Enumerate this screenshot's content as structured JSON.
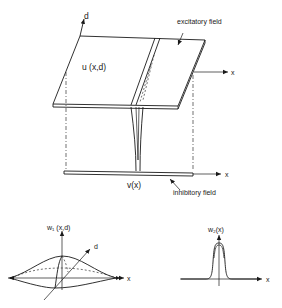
{
  "figure": {
    "top_panel": {
      "excitatory_label": "excitatory field",
      "field_label": "u (x,d)",
      "d_axis_label": "d",
      "x_axis_label": "x"
    },
    "inhibitory_panel": {
      "field_label": "v(x)",
      "inhibitory_label": "inhibitory field",
      "x_axis_label": "x"
    },
    "kernel_w1": {
      "label": "w₁ (x,d)",
      "x_axis_label": "x",
      "d_axis_label": "d"
    },
    "kernel_w2": {
      "label": "w₂(x)",
      "x_axis_label": "x"
    }
  }
}
